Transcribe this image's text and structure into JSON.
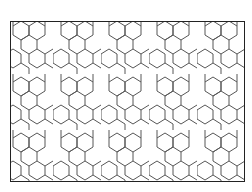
{
  "figure": {
    "type": "geometric-tiling-pattern",
    "stroke_color": "#555555",
    "frame_color": "#222222",
    "background": "#ffffff",
    "tile_width": 48,
    "tile_height": 56
  }
}
